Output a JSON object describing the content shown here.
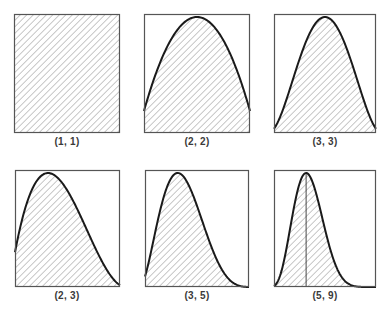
{
  "chart_data": [
    {
      "type": "area",
      "title": "(1, 1)",
      "distribution": "beta",
      "params": {
        "a": 1,
        "b": 1
      },
      "x": [
        0,
        0.25,
        0.5,
        0.75,
        1
      ],
      "values": [
        1,
        1,
        1,
        1,
        1
      ],
      "xlim": [
        0,
        1
      ],
      "ylim": [
        0,
        1
      ],
      "fill": "diagonal-hatch",
      "grid": false,
      "axes_ticks": false
    },
    {
      "type": "area",
      "title": "(2, 2)",
      "distribution": "beta",
      "params": {
        "a": 2,
        "b": 2
      },
      "x": [
        0,
        0.1,
        0.2,
        0.3,
        0.4,
        0.5,
        0.6,
        0.7,
        0.8,
        0.9,
        1
      ],
      "values": [
        0,
        0.36,
        0.64,
        0.84,
        0.96,
        1,
        0.96,
        0.84,
        0.64,
        0.36,
        0
      ],
      "xlim": [
        0,
        1
      ],
      "ylim": [
        0,
        1
      ],
      "fill": "diagonal-hatch",
      "grid": false,
      "axes_ticks": false
    },
    {
      "type": "area",
      "title": "(3, 3)",
      "distribution": "beta",
      "params": {
        "a": 3,
        "b": 3
      },
      "x": [
        0,
        0.1,
        0.2,
        0.3,
        0.4,
        0.5,
        0.6,
        0.7,
        0.8,
        0.9,
        1
      ],
      "values": [
        0,
        0.13,
        0.41,
        0.71,
        0.92,
        1,
        0.92,
        0.71,
        0.41,
        0.13,
        0
      ],
      "xlim": [
        0,
        1
      ],
      "ylim": [
        0,
        1
      ],
      "fill": "diagonal-hatch",
      "grid": false,
      "axes_ticks": false
    },
    {
      "type": "area",
      "title": "(2, 3)",
      "distribution": "beta",
      "params": {
        "a": 2,
        "b": 3
      },
      "x": [
        0,
        0.1,
        0.2,
        0.3,
        0.333,
        0.4,
        0.5,
        0.6,
        0.7,
        0.8,
        0.9,
        1
      ],
      "values": [
        0,
        0.55,
        0.86,
        0.99,
        1,
        0.97,
        0.84,
        0.65,
        0.43,
        0.22,
        0.06,
        0
      ],
      "xlim": [
        0,
        1
      ],
      "ylim": [
        0,
        1
      ],
      "fill": "diagonal-hatch",
      "grid": false,
      "axes_ticks": false
    },
    {
      "type": "area",
      "title": "(3, 5)",
      "distribution": "beta",
      "params": {
        "a": 3,
        "b": 5
      },
      "x": [
        0,
        0.1,
        0.2,
        0.3,
        0.333,
        0.4,
        0.5,
        0.6,
        0.7,
        0.8,
        0.9,
        1
      ],
      "values": [
        0,
        0.22,
        0.68,
        0.97,
        1,
        0.9,
        0.53,
        0.23,
        0.06,
        0.01,
        0,
        0
      ],
      "xlim": [
        0,
        1
      ],
      "ylim": [
        0,
        1
      ],
      "fill": "diagonal-hatch",
      "grid": false,
      "axes_ticks": false
    },
    {
      "type": "area",
      "title": "(5, 9)",
      "distribution": "beta",
      "params": {
        "a": 5,
        "b": 9
      },
      "x": [
        0,
        0.1,
        0.2,
        0.3,
        0.333,
        0.4,
        0.5,
        0.6,
        0.7,
        0.8,
        0.9,
        1
      ],
      "values": [
        0,
        0.05,
        0.47,
        0.96,
        1,
        0.79,
        0.29,
        0.04,
        0,
        0,
        0,
        0
      ],
      "xlim": [
        0,
        1
      ],
      "ylim": [
        0,
        1
      ],
      "fill": "diagonal-hatch",
      "grid": false,
      "axes_ticks": false,
      "annotation": "vertical line at mode"
    }
  ],
  "panels": [
    {
      "label": "(1, 1)"
    },
    {
      "label": "(2, 2)"
    },
    {
      "label": "(3, 3)"
    },
    {
      "label": "(2, 3)"
    },
    {
      "label": "(3, 5)"
    },
    {
      "label": "(5, 9)"
    }
  ],
  "colors": {
    "frame": "#555555",
    "curve": "#1a1a1a",
    "hatch": "#9a9a9a",
    "background": "#ffffff"
  }
}
